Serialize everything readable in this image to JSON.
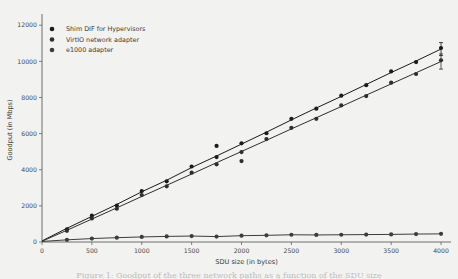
{
  "figure": {
    "caption": "Figure 1: Goodput of the three network paths as a function of the SDU size",
    "background_color": "#f2f2f0"
  },
  "chart_data": {
    "type": "scatter",
    "title": "",
    "xlabel": "SDU size (in bytes)",
    "ylabel": "Goodput (in Mbps)",
    "xlim": [
      0,
      4100
    ],
    "ylim": [
      0,
      12400
    ],
    "xticks": [
      0,
      500,
      1000,
      1500,
      2000,
      2500,
      3000,
      3500,
      4000
    ],
    "yticks": [
      0,
      2000,
      4000,
      6000,
      8000,
      10000,
      12000
    ],
    "xticklabels": [
      "0",
      "500",
      "1000",
      "1500",
      "2000",
      "2500",
      "3000",
      "3500",
      "4000"
    ],
    "yticklabels": [
      "0",
      "2000",
      "4000",
      "6000",
      "8000",
      "10000",
      "12000"
    ],
    "grid": false,
    "legend_position": "upper left",
    "marker": "circle",
    "series": [
      {
        "name": "Shim DIF for Hypervisors",
        "color": "#1b1b1b",
        "line_color": "#1b1b1b",
        "x": [
          0,
          250,
          500,
          750,
          1000,
          1250,
          1500,
          1750,
          2000,
          2250,
          2500,
          2750,
          3000,
          3250,
          3500,
          3750,
          4000
        ],
        "y": [
          60,
          760,
          1420,
          2080,
          2780,
          3420,
          4120,
          4760,
          5420,
          6080,
          6760,
          7420,
          8060,
          8720,
          9380,
          10020,
          10680
        ],
        "scatter_x": [
          250,
          500,
          750,
          1000,
          1250,
          1500,
          1750,
          1750,
          2000,
          2250,
          2500,
          2750,
          3000,
          3250,
          3500,
          3750,
          4000
        ],
        "scatter_y": [
          700,
          1460,
          2020,
          2820,
          3360,
          4180,
          4700,
          5320,
          5460,
          6020,
          6820,
          7380,
          8100,
          8680,
          9440,
          9960,
          10740
        ],
        "errorbars": [
          {
            "x": 4000,
            "y": 10680,
            "err": 360
          }
        ]
      },
      {
        "name": "VirtIO network adapter",
        "color": "#2e2e2e",
        "line_color": "#2e2e2e",
        "x": [
          0,
          250,
          500,
          750,
          1000,
          1250,
          1500,
          1750,
          2000,
          2250,
          2500,
          2750,
          3000,
          3250,
          3500,
          3750,
          4000
        ],
        "y": [
          40,
          650,
          1270,
          1890,
          2520,
          3140,
          3760,
          4390,
          5010,
          5630,
          6260,
          6880,
          7500,
          8130,
          8750,
          9370,
          9990
        ],
        "scatter_x": [
          250,
          500,
          750,
          1000,
          1250,
          1500,
          1750,
          2000,
          2000,
          2250,
          2500,
          2750,
          3000,
          3250,
          3500,
          3750,
          4000
        ],
        "scatter_y": [
          620,
          1300,
          1840,
          2600,
          3080,
          3840,
          4300,
          4980,
          4480,
          5700,
          6320,
          6820,
          7560,
          8080,
          8820,
          9300,
          10060
        ],
        "errorbars": [
          {
            "x": 4000,
            "y": 9990,
            "err": 420
          }
        ]
      },
      {
        "name": "e1000 adapter",
        "color": "#3d3d3d",
        "line_color": "#3d3d3d",
        "x": [
          0,
          250,
          500,
          750,
          1000,
          1250,
          1500,
          1750,
          2000,
          2250,
          2500,
          2750,
          3000,
          3250,
          3500,
          3750,
          4000
        ],
        "y": [
          30,
          120,
          190,
          240,
          280,
          310,
          330,
          300,
          350,
          370,
          400,
          390,
          400,
          410,
          420,
          440,
          450
        ],
        "scatter_x": [
          250,
          500,
          750,
          1000,
          1250,
          1500,
          1750,
          2000,
          2250,
          2500,
          2750,
          3000,
          3250,
          3500,
          3750,
          4000
        ],
        "scatter_y": [
          120,
          190,
          240,
          280,
          310,
          330,
          300,
          350,
          370,
          400,
          390,
          400,
          410,
          420,
          440,
          450
        ],
        "errorbars": []
      }
    ]
  }
}
